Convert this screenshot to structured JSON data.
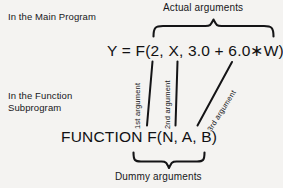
{
  "figure": {
    "background_color": "#f4f3f1",
    "ink_color": "#17171a"
  },
  "labels": {
    "main_program": "In the Main Program",
    "function_subprogram": "In the Function\nSubprogram"
  },
  "captions": {
    "actual_arguments": "Actual arguments",
    "dummy_arguments": "Dummy arguments"
  },
  "code": {
    "call_statement": "Y = F(2, X, 3.0 + 6.0∗W)",
    "function_declaration": "FUNCTION  F(N, A, B)"
  },
  "connectors": [
    {
      "label": "1st argument",
      "actual": "2",
      "dummy": "N"
    },
    {
      "label": "2nd argument",
      "actual": "X",
      "dummy": "A"
    },
    {
      "label": "3rd argument",
      "actual": "3.0 + 6.0∗W",
      "dummy": "B"
    }
  ],
  "braces": {
    "top": {
      "name": "actual-arguments-brace",
      "orientation": "down"
    },
    "bottom": {
      "name": "dummy-arguments-brace",
      "orientation": "up"
    }
  }
}
